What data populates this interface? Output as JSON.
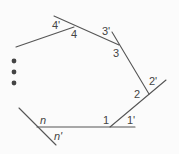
{
  "diagram": {
    "line_color": "#555555",
    "text_color": "#444444",
    "vertex_labels": [
      "4",
      "3",
      "2",
      "1",
      "n"
    ],
    "exterior_labels": [
      "4'",
      "3'",
      "2'",
      "1'",
      "n'"
    ],
    "ellipsis_dots": 3
  }
}
